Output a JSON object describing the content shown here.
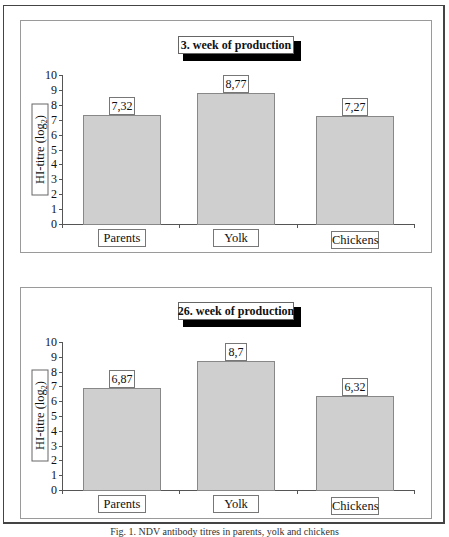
{
  "figure": {
    "caption": "Fig. 1. NDV antibody titres in parents, yolk and chickens"
  },
  "chart_data": [
    {
      "type": "bar",
      "title": "3. week of production",
      "xlabel": "",
      "ylabel": "HI-titre (log2)",
      "ylabel_main": "HI-titre (log",
      "ylabel_sub": "2",
      "ylabel_end": ")",
      "ylim": [
        0,
        10
      ],
      "yticks": [
        "0",
        "1",
        "2",
        "3",
        "4",
        "5",
        "6",
        "7",
        "8",
        "9",
        "10"
      ],
      "categories": [
        "Parents",
        "Yolk",
        "Chickens"
      ],
      "values": [
        7.32,
        8.77,
        7.27
      ],
      "value_labels": [
        "7,32",
        "8,77",
        "7,27"
      ],
      "grid": false,
      "bar_color": "#cfcfcf"
    },
    {
      "type": "bar",
      "title": "26. week of production",
      "xlabel": "",
      "ylabel": "HI-titre (log2)",
      "ylabel_main": "HI-titre (log",
      "ylabel_sub": "2",
      "ylabel_end": ")",
      "ylim": [
        0,
        10
      ],
      "yticks": [
        "0",
        "1",
        "2",
        "3",
        "4",
        "5",
        "6",
        "7",
        "8",
        "9",
        "10"
      ],
      "categories": [
        "Parents",
        "Yolk",
        "Chickens"
      ],
      "values": [
        6.87,
        8.7,
        6.32
      ],
      "value_labels": [
        "6,87",
        "8,7",
        "6,32"
      ],
      "grid": false,
      "bar_color": "#cfcfcf"
    }
  ]
}
